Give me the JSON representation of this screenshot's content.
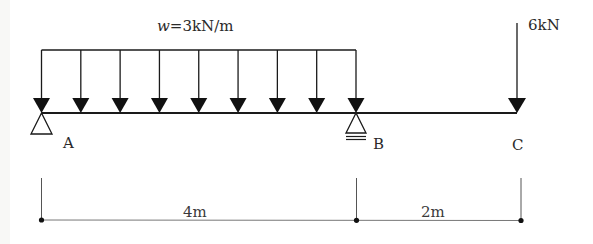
{
  "diagram": {
    "type": "simply supported beam with overhang",
    "distributed_load": {
      "label_var": "w",
      "label_eq": "=3kN/m",
      "value": 3,
      "unit": "kN/m",
      "from": "A",
      "to": "B",
      "arrow_count": 9
    },
    "point_load": {
      "label": "6kN",
      "value": 6,
      "unit": "kN",
      "at": "C"
    },
    "supports": [
      {
        "point": "A",
        "type": "pin"
      },
      {
        "point": "B",
        "type": "roller"
      }
    ],
    "points": [
      {
        "label": "A"
      },
      {
        "label": "B"
      },
      {
        "label": "C"
      }
    ],
    "dimensions": [
      {
        "label": "4m",
        "from": "A",
        "to": "B"
      },
      {
        "label": "2m",
        "from": "B",
        "to": "C"
      }
    ],
    "colors": {
      "line": "#1a1a1a",
      "text": "#2a2a2a"
    }
  }
}
